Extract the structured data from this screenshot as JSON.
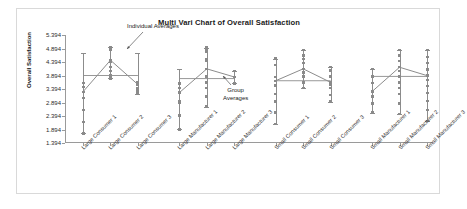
{
  "chart_data": {
    "type": "line",
    "title": "Multi Vari Chart of Overall Satisfaction",
    "xlabel": "",
    "ylabel": "Overall Satisfaction",
    "ylim": [
      1.394,
      5.394
    ],
    "yticks": [
      "5.394",
      "4.894",
      "4.394",
      "3.894",
      "3.394",
      "2.894",
      "2.394",
      "1.894",
      "1.394"
    ],
    "ytick_values": [
      5.394,
      4.894,
      4.394,
      3.894,
      3.394,
      2.894,
      2.394,
      1.894,
      1.394
    ],
    "grid": false,
    "legend": "none",
    "categories": [
      "Large Consumer 1",
      "Large Consumer 2",
      "Large Consumer 3",
      "Large Manufacturer 1",
      "Large Manufacturer 2",
      "Large Manufacturer 3",
      "Small Consumer 1",
      "Small Consumer 2",
      "Small Consumer 3",
      "Small Manufacturer 1",
      "Small Manufacturer 2",
      "Small Manufacturer 3"
    ],
    "groups": [
      {
        "name": "Large Consumer",
        "group_average": 3.894,
        "levels": [
          {
            "label": "Large Consumer 1",
            "individual_average": 3.29,
            "whisker_low": 1.75,
            "whisker_high": 4.72,
            "points": [
              1.75,
              2.17,
              2.62,
              3.06,
              3.29,
              3.46,
              3.62
            ]
          },
          {
            "label": "Large Consumer 2",
            "individual_average": 4.46,
            "whisker_low": 3.79,
            "whisker_high": 4.95,
            "points": [
              3.79,
              3.9,
              4.05,
              4.2,
              4.39,
              4.46,
              4.85,
              4.93
            ]
          },
          {
            "label": "Large Consumer 3",
            "individual_average": 3.56,
            "whisker_low": 3.2,
            "whisker_high": 4.72,
            "points": [
              3.2,
              3.3,
              3.42,
              3.56,
              3.63
            ]
          }
        ]
      },
      {
        "name": "Large Manufacturer",
        "group_average": 3.78,
        "levels": [
          {
            "label": "Large Manufacturer 1",
            "individual_average": 3.26,
            "whisker_low": 1.9,
            "whisker_high": 4.13,
            "points": [
              1.9,
              2.41,
              2.89,
              2.96,
              3.26,
              3.43,
              3.6
            ]
          },
          {
            "label": "Large Manufacturer 2",
            "individual_average": 4.14,
            "whisker_low": 2.74,
            "whisker_high": 4.93,
            "points": [
              2.74,
              3.12,
              3.43,
              3.64,
              3.86,
              4.14,
              4.43,
              4.5,
              4.78,
              4.85,
              4.93
            ]
          },
          {
            "label": "Large Manufacturer 3",
            "individual_average": 3.84,
            "whisker_low": 3.6,
            "whisker_high": 4.06,
            "points": [
              3.6,
              3.84,
              4.06
            ]
          }
        ]
      },
      {
        "name": "Small Consumer",
        "group_average": 3.7,
        "levels": [
          {
            "label": "Small Consumer 1",
            "individual_average": 3.7,
            "whisker_low": 2.1,
            "whisker_high": 4.52,
            "points": [
              2.1,
              2.52,
              2.93,
              3.2,
              3.52,
              3.7,
              3.85,
              4.28,
              4.52
            ]
          },
          {
            "label": "Small Consumer 2",
            "individual_average": 4.14,
            "whisker_low": 3.43,
            "whisker_high": 4.85,
            "points": [
              3.43,
              3.64,
              3.86,
              4.0,
              4.14,
              4.36,
              4.5,
              4.64,
              4.85
            ]
          },
          {
            "label": "Small Consumer 3",
            "individual_average": 3.64,
            "whisker_low": 2.93,
            "whisker_high": 4.2,
            "points": [
              2.93,
              3.17,
              3.43,
              3.55,
              3.64,
              3.86,
              4.08,
              4.2
            ]
          }
        ]
      },
      {
        "name": "Small Manufacturer",
        "group_average": 3.86,
        "levels": [
          {
            "label": "Small Manufacturer 1",
            "individual_average": 3.3,
            "whisker_low": 2.52,
            "whisker_high": 4.13,
            "points": [
              2.52,
              2.86,
              3.12,
              3.3,
              3.62,
              3.86,
              4.13
            ]
          },
          {
            "label": "Small Manufacturer 2",
            "individual_average": 4.2,
            "whisker_low": 2.46,
            "whisker_high": 4.85,
            "points": [
              2.46,
              2.86,
              3.2,
              3.43,
              3.64,
              3.86,
              4.05,
              4.2,
              4.43,
              4.64,
              4.85
            ]
          },
          {
            "label": "Small Manufacturer 3",
            "individual_average": 3.89,
            "whisker_low": 2.2,
            "whisker_high": 4.85,
            "points": [
              2.2,
              2.62,
              2.96,
              3.25,
              3.5,
              3.72,
              3.89,
              4.12,
              4.36,
              4.58,
              4.85
            ]
          }
        ]
      }
    ],
    "annotations": [
      {
        "id": "individual-averages",
        "text": "Individual Averages"
      },
      {
        "id": "group-averages",
        "text": "Group",
        "text2": "Averages"
      }
    ],
    "colors": {
      "line": "#8c8c8c",
      "point": "#8a8a8a",
      "axis": "#9a9a9a",
      "text": "#1a1a1a",
      "border": "#d9d9d9",
      "background": "#ffffff"
    }
  }
}
